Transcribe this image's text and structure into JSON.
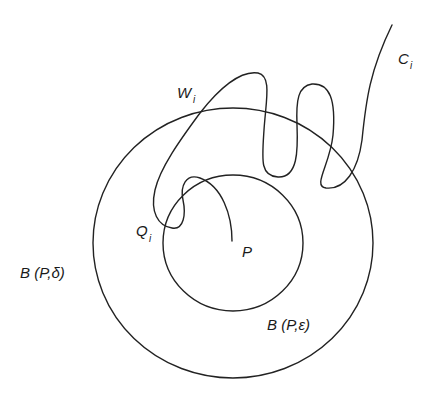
{
  "figure": {
    "type": "topology-diagram",
    "labels": {
      "curve": {
        "main": "C",
        "sub": "i"
      },
      "arc": {
        "main": "W",
        "sub": "i"
      },
      "point_q": {
        "main": "Q",
        "sub": "i"
      },
      "point_p": "P",
      "outer_ball": "B (P,δ)",
      "inner_ball": "B (P,ε)"
    },
    "shapes": {
      "outer_ball": {
        "cx": 233,
        "cy": 243,
        "rx": 140,
        "ry": 135
      },
      "inner_ball": {
        "cx": 233,
        "cy": 243,
        "rx": 70,
        "ry": 68
      }
    },
    "colors": {
      "stroke": "#222222",
      "background": "#ffffff"
    }
  }
}
